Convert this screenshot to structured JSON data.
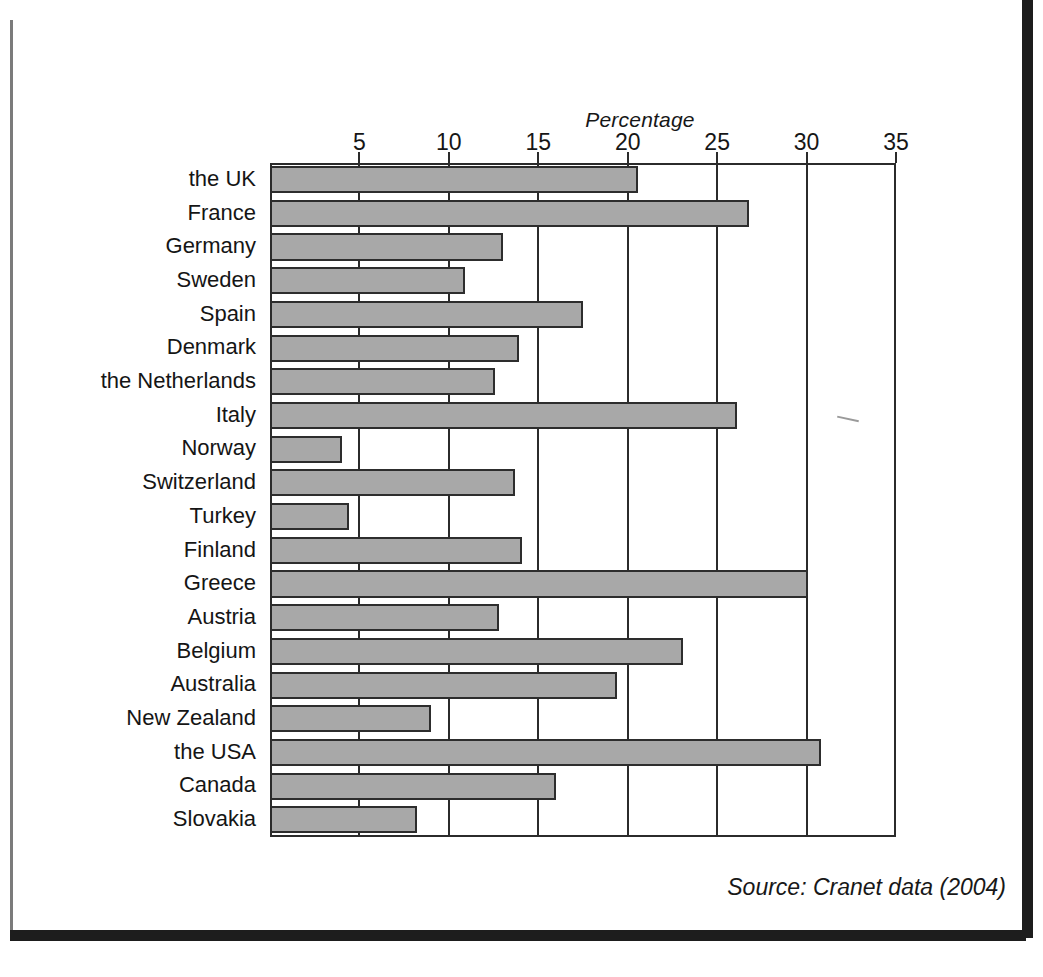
{
  "chart_data": {
    "type": "bar",
    "orientation": "horizontal",
    "title": "",
    "xlabel": "Percentage",
    "ylabel": "",
    "xlim": [
      0,
      35
    ],
    "xticks": [
      5,
      10,
      15,
      20,
      25,
      30,
      35
    ],
    "grid": true,
    "legend": null,
    "categories": [
      "the UK",
      "France",
      "Germany",
      "Sweden",
      "Spain",
      "Denmark",
      "the Netherlands",
      "Italy",
      "Norway",
      "Switzerland",
      "Turkey",
      "Finland",
      "Greece",
      "Austria",
      "Belgium",
      "Australia",
      "New Zealand",
      "the USA",
      "Canada",
      "Slovakia"
    ],
    "values": [
      20.6,
      26.8,
      13.0,
      10.9,
      17.5,
      13.9,
      12.6,
      26.1,
      4.0,
      13.7,
      4.4,
      14.1,
      30.1,
      12.8,
      23.1,
      19.4,
      9.0,
      30.8,
      16.0,
      8.2
    ],
    "bar_color": "#a8a8a8",
    "bar_edge_color": "#2d2d2d",
    "axis_color": "#2b2b2b",
    "source": "Source: Cranet data (2004)"
  }
}
